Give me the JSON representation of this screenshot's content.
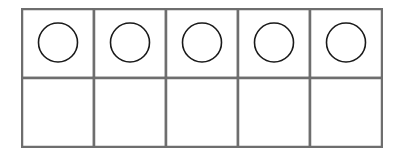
{
  "diagram": {
    "type": "ten-frame-variant",
    "rows": 2,
    "columns": 5,
    "grid_color": "#6e6e6e",
    "circle_color": "#1a1a1a",
    "cells": [
      [
        {
          "circle": true
        },
        {
          "circle": true
        },
        {
          "circle": true
        },
        {
          "circle": true
        },
        {
          "circle": true
        }
      ],
      [
        {
          "circle": false
        },
        {
          "circle": false
        },
        {
          "circle": false
        },
        {
          "circle": false
        },
        {
          "circle": false
        }
      ]
    ],
    "filled_count": 5,
    "empty_count": 5
  }
}
